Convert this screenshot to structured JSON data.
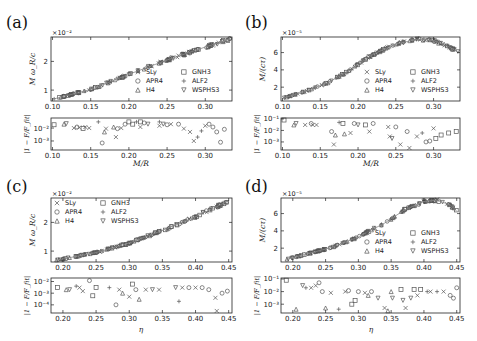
{
  "figure": {
    "legend_entries": [
      {
        "label": "SLy",
        "marker": "x-icon"
      },
      {
        "label": "GNH3",
        "marker": "square-icon"
      },
      {
        "label": "APR4",
        "marker": "circle-icon"
      },
      {
        "label": "ALF2",
        "marker": "plus-icon"
      },
      {
        "label": "H4",
        "marker": "triangle-up-icon"
      },
      {
        "label": "WSPHS3",
        "marker": "triangle-down-icon"
      }
    ],
    "colors": {
      "markers": "#555555",
      "fit_line": "#888888",
      "axes": "#222222"
    }
  },
  "chart_data": [
    {
      "panel": "(a)",
      "type": "scatter",
      "xlabel": "M/R",
      "ylabel": "M ω_R/c",
      "y_multiplier": "×10⁻²",
      "xlim": [
        0.098,
        0.335
      ],
      "ylim": [
        0.62,
        2.85
      ],
      "xticks": [
        "0.10",
        "0.15",
        "0.20",
        "0.25",
        "0.30"
      ],
      "yticks": [
        "1",
        "2"
      ],
      "legend_position": "lower right",
      "fit": [
        [
          0.1,
          0.68
        ],
        [
          0.15,
          1.02
        ],
        [
          0.2,
          1.55
        ],
        [
          0.25,
          2.05
        ],
        [
          0.3,
          2.5
        ],
        [
          0.333,
          2.78
        ]
      ],
      "residual": {
        "ylabel": "|1 − F/F_fit|",
        "yscale": "log",
        "ylim": [
          0.0002,
          0.06
        ],
        "yticks": [
          "10⁻²",
          "10⁻³"
        ],
        "points": [
          [
            0.102,
            0.018,
            "sq"
          ],
          [
            0.115,
            0.02,
            "tu"
          ],
          [
            0.118,
            0.022,
            "td"
          ],
          [
            0.128,
            0.01,
            "x"
          ],
          [
            0.132,
            0.012,
            "ci"
          ],
          [
            0.135,
            0.011,
            "x"
          ],
          [
            0.14,
            0.009,
            "sq"
          ],
          [
            0.143,
            0.012,
            "x"
          ],
          [
            0.148,
            0.01,
            "x"
          ],
          [
            0.165,
            0.0007,
            "ci"
          ],
          [
            0.168,
            0.005,
            "tu"
          ],
          [
            0.17,
            0.009,
            "x"
          ],
          [
            0.18,
            0.012,
            "tu"
          ],
          [
            0.183,
            0.002,
            "x"
          ],
          [
            0.185,
            0.009,
            "ci"
          ],
          [
            0.19,
            0.01,
            "x"
          ],
          [
            0.195,
            0.02,
            "ci"
          ],
          [
            0.205,
            0.02,
            "sq"
          ],
          [
            0.215,
            0.012,
            "x"
          ],
          [
            0.22,
            0.025,
            "ci"
          ],
          [
            0.225,
            0.02,
            "td"
          ],
          [
            0.24,
            0.015,
            "x"
          ],
          [
            0.245,
            0.02,
            "td"
          ],
          [
            0.25,
            0.018,
            "ci"
          ],
          [
            0.255,
            0.02,
            "x"
          ],
          [
            0.265,
            0.02,
            "ci"
          ],
          [
            0.272,
            0.009,
            "x"
          ],
          [
            0.28,
            0.005,
            "x"
          ],
          [
            0.285,
            0.001,
            "x"
          ],
          [
            0.29,
            0.002,
            "pl"
          ],
          [
            0.295,
            0.006,
            "pl"
          ],
          [
            0.3,
            0.015,
            "x"
          ],
          [
            0.305,
            0.02,
            "ci"
          ],
          [
            0.31,
            0.012,
            "ci"
          ],
          [
            0.315,
            0.005,
            "ci"
          ],
          [
            0.32,
            0.0008,
            "ci"
          ],
          [
            0.325,
            0.008,
            "ci"
          ],
          [
            0.16,
            0.03,
            "pl"
          ],
          [
            0.21,
            0.03,
            "pl"
          ],
          [
            0.24,
            0.03,
            "pl"
          ],
          [
            0.2,
            0.03,
            "sq"
          ],
          [
            0.215,
            0.03,
            "sq"
          ]
        ]
      }
    },
    {
      "panel": "(b)",
      "type": "scatter",
      "xlabel": "M/R",
      "ylabel": "M/(cτ)",
      "y_multiplier": "×10⁻⁵",
      "xlim": [
        0.098,
        0.335
      ],
      "ylim": [
        0.4,
        7.8
      ],
      "xticks": [
        "0.10",
        "0.15",
        "0.20",
        "0.25",
        "0.30"
      ],
      "yticks": [
        "2",
        "4",
        "6"
      ],
      "legend_position": "lower right",
      "fit": [
        [
          0.1,
          0.7
        ],
        [
          0.13,
          1.5
        ],
        [
          0.16,
          2.5
        ],
        [
          0.19,
          4.0
        ],
        [
          0.22,
          5.8
        ],
        [
          0.25,
          7.0
        ],
        [
          0.28,
          7.55
        ],
        [
          0.3,
          7.4
        ],
        [
          0.32,
          6.7
        ],
        [
          0.333,
          6.0
        ]
      ],
      "residual": {
        "ylabel": "|1 − F/F_fit|",
        "yscale": "log",
        "ylim": [
          0.0002,
          0.12
        ],
        "yticks": [
          "10⁻¹",
          "10⁻²",
          "10⁻³"
        ],
        "points": [
          [
            0.102,
            0.08,
            "sq"
          ],
          [
            0.115,
            0.03,
            "tu"
          ],
          [
            0.118,
            0.04,
            "td"
          ],
          [
            0.13,
            0.03,
            "x"
          ],
          [
            0.138,
            0.04,
            "ci"
          ],
          [
            0.14,
            0.03,
            "x"
          ],
          [
            0.145,
            0.03,
            "x"
          ],
          [
            0.165,
            0.008,
            "ci"
          ],
          [
            0.168,
            0.0006,
            "x"
          ],
          [
            0.17,
            0.004,
            "tu"
          ],
          [
            0.175,
            0.05,
            "pl"
          ],
          [
            0.18,
            0.04,
            "sq"
          ],
          [
            0.182,
            0.005,
            "tu"
          ],
          [
            0.19,
            0.006,
            "x"
          ],
          [
            0.195,
            0.04,
            "ci"
          ],
          [
            0.2,
            0.03,
            "td"
          ],
          [
            0.21,
            0.03,
            "sq"
          ],
          [
            0.215,
            0.008,
            "x"
          ],
          [
            0.22,
            0.04,
            "ci"
          ],
          [
            0.24,
            0.02,
            "x"
          ],
          [
            0.242,
            0.003,
            "x"
          ],
          [
            0.245,
            0.002,
            "td"
          ],
          [
            0.25,
            0.02,
            "ci"
          ],
          [
            0.256,
            0.0006,
            "x"
          ],
          [
            0.265,
            0.008,
            "ci"
          ],
          [
            0.268,
            0.0003,
            "x"
          ],
          [
            0.278,
            0.003,
            "x"
          ],
          [
            0.285,
            0.006,
            "pl"
          ],
          [
            0.29,
            0.001,
            "ci"
          ],
          [
            0.295,
            0.0012,
            "ci"
          ],
          [
            0.3,
            0.015,
            "x"
          ],
          [
            0.303,
            0.002,
            "sq"
          ],
          [
            0.31,
            0.004,
            "sq"
          ],
          [
            0.32,
            0.006,
            "sq"
          ],
          [
            0.33,
            0.008,
            "sq"
          ]
        ]
      }
    },
    {
      "panel": "(c)",
      "type": "scatter",
      "xlabel": "η",
      "ylabel": "M ω_R/c",
      "y_multiplier": "×10⁻²",
      "xlim": [
        0.182,
        0.455
      ],
      "ylim": [
        0.62,
        2.85
      ],
      "xticks": [
        "0.20",
        "0.25",
        "0.30",
        "0.35",
        "0.40",
        "0.45"
      ],
      "yticks": [
        "1",
        "2"
      ],
      "legend_position": "upper left",
      "fit": [
        [
          0.19,
          0.68
        ],
        [
          0.25,
          0.95
        ],
        [
          0.3,
          1.28
        ],
        [
          0.35,
          1.72
        ],
        [
          0.4,
          2.2
        ],
        [
          0.45,
          2.75
        ]
      ],
      "residual": {
        "ylabel": "|1 − F/F_fit|",
        "yscale": "log",
        "ylim": [
          2e-05,
          0.02
        ],
        "yticks": [
          "10⁻²",
          "10⁻³",
          "10⁻⁴"
        ],
        "points": [
          [
            0.192,
            0.003,
            "sq"
          ],
          [
            0.205,
            0.002,
            "tu"
          ],
          [
            0.21,
            0.002,
            "td"
          ],
          [
            0.22,
            0.004,
            "pl"
          ],
          [
            0.225,
            0.003,
            "x"
          ],
          [
            0.23,
            0.0015,
            "x"
          ],
          [
            0.24,
            0.012,
            "ci"
          ],
          [
            0.245,
            0.0006,
            "sq"
          ],
          [
            0.25,
            0.003,
            "sq"
          ],
          [
            0.27,
            0.003,
            "pl"
          ],
          [
            0.28,
            0.0001,
            "ci"
          ],
          [
            0.285,
            0.002,
            "x"
          ],
          [
            0.29,
            0.001,
            "tu"
          ],
          [
            0.3,
            0.0005,
            "x"
          ],
          [
            0.305,
            0.006,
            "sq"
          ],
          [
            0.31,
            0.002,
            "ci"
          ],
          [
            0.315,
            0.0003,
            "tu"
          ],
          [
            0.325,
            0.002,
            "x"
          ],
          [
            0.335,
            0.002,
            "td"
          ],
          [
            0.345,
            0.002,
            "x"
          ],
          [
            0.37,
            0.003,
            "td"
          ],
          [
            0.375,
            0.0002,
            "pl"
          ],
          [
            0.38,
            0.003,
            "x"
          ],
          [
            0.39,
            0.003,
            "ci"
          ],
          [
            0.4,
            0.003,
            "x"
          ],
          [
            0.41,
            0.003,
            "ci"
          ],
          [
            0.42,
            0.002,
            "ci"
          ],
          [
            0.43,
            0.0004,
            "x"
          ],
          [
            0.432,
            3e-05,
            "x"
          ],
          [
            0.44,
            0.001,
            "ci"
          ],
          [
            0.448,
            0.0015,
            "ci"
          ]
        ]
      }
    },
    {
      "panel": "(d)",
      "type": "scatter",
      "xlabel": "η",
      "ylabel": "M/(cτ)",
      "y_multiplier": "×10⁻⁵",
      "xlim": [
        0.182,
        0.455
      ],
      "ylim": [
        0.4,
        7.8
      ],
      "xticks": [
        "0.20",
        "0.25",
        "0.30",
        "0.35",
        "0.40",
        "0.45"
      ],
      "yticks": [
        "2",
        "4",
        "6"
      ],
      "legend_position": "lower right",
      "fit": [
        [
          0.19,
          0.7
        ],
        [
          0.22,
          1.3
        ],
        [
          0.26,
          2.1
        ],
        [
          0.3,
          3.3
        ],
        [
          0.34,
          4.9
        ],
        [
          0.37,
          6.4
        ],
        [
          0.4,
          7.4
        ],
        [
          0.42,
          7.55
        ],
        [
          0.44,
          7.0
        ],
        [
          0.45,
          6.3
        ]
      ],
      "residual": {
        "ylabel": "|1 − F/F_fit|",
        "yscale": "log",
        "ylim": [
          0.0002,
          0.12
        ],
        "yticks": [
          "10⁻¹",
          "10⁻²",
          "10⁻³"
        ],
        "points": [
          [
            0.19,
            0.08,
            "sq"
          ],
          [
            0.205,
            0.0004,
            "tu"
          ],
          [
            0.215,
            0.03,
            "td"
          ],
          [
            0.22,
            0.02,
            "pl"
          ],
          [
            0.228,
            0.02,
            "x"
          ],
          [
            0.235,
            0.03,
            "x"
          ],
          [
            0.24,
            0.05,
            "ci"
          ],
          [
            0.245,
            0.01,
            "ci"
          ],
          [
            0.25,
            0.0005,
            "tu"
          ],
          [
            0.258,
            0.008,
            "x"
          ],
          [
            0.27,
            0.0004,
            "pl"
          ],
          [
            0.28,
            0.01,
            "x"
          ],
          [
            0.285,
            0.012,
            "ci"
          ],
          [
            0.29,
            0.001,
            "sq"
          ],
          [
            0.295,
            0.002,
            "sq"
          ],
          [
            0.3,
            0.01,
            "ci"
          ],
          [
            0.31,
            0.008,
            "x"
          ],
          [
            0.315,
            0.005,
            "tu"
          ],
          [
            0.32,
            0.01,
            "ci"
          ],
          [
            0.33,
            0.003,
            "td"
          ],
          [
            0.34,
            0.0005,
            "x"
          ],
          [
            0.345,
            0.0003,
            "tu"
          ],
          [
            0.35,
            0.01,
            "tu"
          ],
          [
            0.352,
            0.003,
            "td"
          ],
          [
            0.365,
            0.015,
            "sq"
          ],
          [
            0.368,
            0.002,
            "td"
          ],
          [
            0.372,
            0.0005,
            "x"
          ],
          [
            0.38,
            0.003,
            "td"
          ],
          [
            0.385,
            0.015,
            "sq"
          ],
          [
            0.39,
            0.005,
            "x"
          ],
          [
            0.395,
            0.015,
            "sq"
          ],
          [
            0.405,
            0.01,
            "pl"
          ],
          [
            0.41,
            0.01,
            "x"
          ],
          [
            0.42,
            0.01,
            "pl"
          ],
          [
            0.43,
            0.01,
            "x"
          ],
          [
            0.44,
            0.005,
            "ci"
          ],
          [
            0.445,
            0.003,
            "ci"
          ],
          [
            0.45,
            0.02,
            "ci"
          ]
        ]
      }
    }
  ]
}
